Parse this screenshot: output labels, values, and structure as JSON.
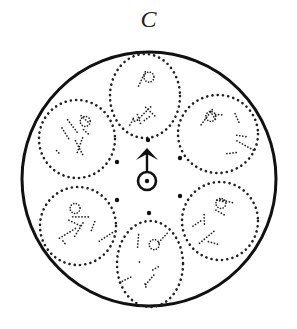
{
  "diagram": {
    "label": "C",
    "outer_circle": {
      "cx": 149,
      "cy": 179,
      "r": 127,
      "stroke": "#111111",
      "stroke_width": 3
    },
    "panels": [
      {
        "id": "top",
        "cx": 145,
        "cy": 96,
        "rx": 35,
        "ry": 42,
        "figure": "standing-figure"
      },
      {
        "id": "upper-left",
        "cx": 77,
        "cy": 139,
        "rx": 38,
        "ry": 39,
        "figure": "reclining-figure"
      },
      {
        "id": "upper-right",
        "cx": 218,
        "cy": 134,
        "rx": 40,
        "ry": 39,
        "figure": "kneeling-figure"
      },
      {
        "id": "lower-left",
        "cx": 78,
        "cy": 226,
        "rx": 38,
        "ry": 39,
        "figure": "crouching-figure"
      },
      {
        "id": "lower-right",
        "cx": 220,
        "cy": 221,
        "rx": 38,
        "ry": 39,
        "figure": "fallen-figure"
      },
      {
        "id": "bottom",
        "cx": 150,
        "cy": 264,
        "rx": 33,
        "ry": 43,
        "figure": "standing-figure"
      }
    ],
    "marker_dots": [
      {
        "x": 148,
        "y": 140
      },
      {
        "x": 117,
        "y": 162
      },
      {
        "x": 180,
        "y": 158
      },
      {
        "x": 117,
        "y": 200
      },
      {
        "x": 180,
        "y": 196
      },
      {
        "x": 149,
        "y": 213
      }
    ],
    "center_symbol": {
      "name": "mars-like-circle-arrow",
      "circle": {
        "cx": 147,
        "cy": 181,
        "r": 9
      },
      "arrow_tip": {
        "x": 147,
        "y": 148
      }
    }
  }
}
